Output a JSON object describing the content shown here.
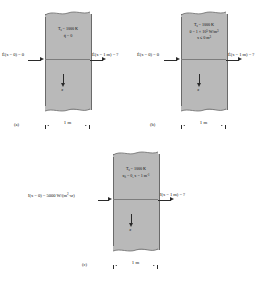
{
  "figure": {
    "type": "technical-diagram",
    "slab_thickness": "1 m"
  },
  "panels": [
    {
      "id": "a",
      "caption": "(a)",
      "properties": [
        {
          "text": "T",
          "sub": "s",
          "rest": " = 1000 K"
        },
        {
          "text": "q̇ = 0",
          "sub": "",
          "rest": ""
        }
      ],
      "property_lines": [
        "T_s = 1000 K",
        "q̇ = 0"
      ],
      "left_label": "Ė(x = 0) = 0",
      "right_label": "Ė(x = 1 m) = ?",
      "axis_label": "x",
      "dimension": "1 m"
    },
    {
      "id": "b",
      "caption": "(b)",
      "property_lines": [
        "T_s = 1000 K",
        "θ = 1 × 10⁵ W/m³",
        "x ≤ 0 m³"
      ],
      "left_label": "Ė(x = 0) = 0",
      "right_label": "Ė(x = 1 m) = ?",
      "axis_label": "x",
      "dimension": "1 m"
    },
    {
      "id": "c",
      "caption": "(c)",
      "property_lines": [
        "T_s = 1000 K",
        "κλ = 0, x = 1 m⁻¹"
      ],
      "left_label": "I(x = 0) = 5000 W/(m²·sr)",
      "right_label": "I(x = 1 m) = ?",
      "axis_label": "x",
      "dimension": "1 m"
    }
  ],
  "labels": {
    "panel_a_line1_pre": "T",
    "panel_a_line1_sub": "s",
    "panel_a_line1_post": " = 1000 K",
    "panel_a_line2": "q̇ = 0",
    "panel_b_line1_pre": "T",
    "panel_b_line1_sub": "s",
    "panel_b_line1_post": " = 1000 K",
    "panel_b_line2": "θ = 1 × 10",
    "panel_b_line2_sup": "5",
    "panel_b_line2_post": " W/m",
    "panel_b_line2_sup2": "3",
    "panel_b_line3": "x ≤ 0 m",
    "panel_b_line3_sup": "3",
    "panel_c_line1_pre": "T",
    "panel_c_line1_sub": "s",
    "panel_c_line1_post": " = 1000 K",
    "panel_c_line2_pre": "κ",
    "panel_c_line2_sub": "λ",
    "panel_c_line2_post": " = 0, x = 1 m",
    "panel_c_line2_sup": "-1",
    "a_left_pre": "Ė(x = 0) = 0",
    "a_right_pre": "Ė(x = 1 m) = ?",
    "b_left_pre": "Ė(x = 0) = 0",
    "b_right_pre": "Ė(x = 1 m) = ?",
    "c_left_pre": "I(x = 0) = 5000 W/(m",
    "c_left_sup": "2",
    "c_left_post": "·sr)",
    "c_right_pre": "I(x = 1 m) = ?",
    "dimension": "1 m",
    "axis": "x",
    "caption_a": "(a)",
    "caption_b": "(b)",
    "caption_c": "(c)"
  },
  "colors": {
    "slab_fill": "#b9b9b9",
    "slab_edge": "#6a6a6a",
    "arrow": "#2a2a2a",
    "text": "#111111",
    "background": "#ffffff"
  }
}
